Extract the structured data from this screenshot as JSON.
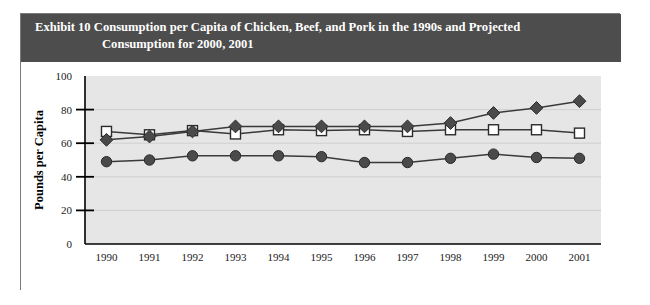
{
  "exhibit": {
    "label": "Exhibit 10",
    "title_line1": "Consumption per Capita of Chicken, Beef, and Pork in the 1990s and Projected",
    "title_line2": "Consumption for 2000, 2001",
    "header_bg": "#4d4d4d",
    "header_text_color": "#ffffff",
    "frame_border": "#7a7a7a"
  },
  "chart_data": {
    "type": "line",
    "title": "",
    "xlabel": "",
    "ylabel": "Pounds per Capita",
    "categories": [
      "1990",
      "1991",
      "1992",
      "1993",
      "1994",
      "1995",
      "1996",
      "1997",
      "1998",
      "1999",
      "2000",
      "2001"
    ],
    "ylim": [
      0,
      100
    ],
    "yticks": [
      0,
      20,
      40,
      60,
      80,
      100
    ],
    "grid": true,
    "legend": "none",
    "plot_bg": "#e6e6e6",
    "series": [
      {
        "name": "Beef",
        "marker": "square-open",
        "color": "#ffffff",
        "values": [
          67,
          65,
          67.5,
          65.5,
          68,
          67.5,
          68,
          67,
          68,
          68,
          68,
          66
        ]
      },
      {
        "name": "Chicken",
        "marker": "diamond-filled",
        "color": "#4a4a4a",
        "values": [
          62,
          64,
          67,
          70,
          70,
          70,
          70,
          70,
          72,
          78,
          81,
          85
        ]
      },
      {
        "name": "Pork",
        "marker": "circle-filled",
        "color": "#4a4a4a",
        "values": [
          49,
          50,
          52.5,
          52.5,
          52.5,
          52,
          48.5,
          48.5,
          51,
          53.5,
          51.5,
          51
        ]
      }
    ]
  }
}
